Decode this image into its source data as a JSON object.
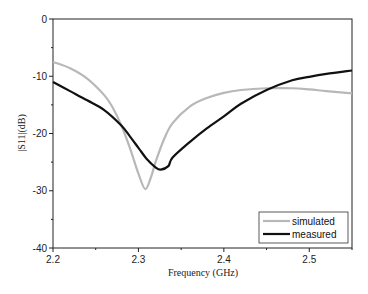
{
  "chart_data": {
    "type": "line",
    "title": "",
    "xlabel": "Frequency (GHz)",
    "ylabel": "|S11|(dB)",
    "xlim": [
      2.2,
      2.55
    ],
    "ylim": [
      -40,
      0
    ],
    "xticks": [
      2.2,
      2.3,
      2.4,
      2.5
    ],
    "xtick_labels": [
      "2.2",
      "2.3",
      "2.4",
      "2.5"
    ],
    "yticks": [
      0,
      -10,
      -20,
      -30,
      -40
    ],
    "ytick_labels": [
      "0",
      "-10",
      "-20",
      "-30",
      "-40"
    ],
    "grid": false,
    "legend_position": "lower right",
    "series": [
      {
        "name": "simulated",
        "color": "#b8b8b8",
        "x": [
          2.2,
          2.22,
          2.24,
          2.26,
          2.27,
          2.28,
          2.29,
          2.3,
          2.308,
          2.315,
          2.32,
          2.33,
          2.34,
          2.36,
          2.38,
          2.4,
          2.42,
          2.45,
          2.48,
          2.5,
          2.52,
          2.55
        ],
        "y": [
          -7.5,
          -8.6,
          -10.4,
          -13.3,
          -15.5,
          -18.6,
          -22.5,
          -27.0,
          -29.7,
          -27.5,
          -25.0,
          -21.0,
          -18.2,
          -15.3,
          -13.8,
          -12.9,
          -12.4,
          -12.1,
          -12.1,
          -12.3,
          -12.6,
          -13.0
        ]
      },
      {
        "name": "measured",
        "color": "#111111",
        "x": [
          2.2,
          2.22,
          2.24,
          2.26,
          2.28,
          2.29,
          2.3,
          2.31,
          2.32,
          2.326,
          2.335,
          2.34,
          2.36,
          2.38,
          2.4,
          2.42,
          2.45,
          2.48,
          2.5,
          2.52,
          2.55
        ],
        "y": [
          -11.0,
          -12.6,
          -14.2,
          -15.9,
          -18.6,
          -20.5,
          -22.5,
          -24.5,
          -25.9,
          -26.3,
          -25.7,
          -24.2,
          -21.5,
          -19.1,
          -17.0,
          -14.8,
          -12.4,
          -10.7,
          -10.1,
          -9.6,
          -9.0
        ]
      }
    ]
  },
  "legend": {
    "items": [
      "simulated",
      "measured"
    ]
  }
}
